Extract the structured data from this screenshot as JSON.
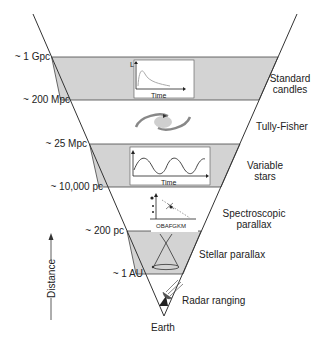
{
  "diagram": {
    "axis_label": "Distance",
    "base_label": "Earth",
    "colors": {
      "band_fill": "#d3d3d3",
      "line": "#333333",
      "background": "#ffffff"
    },
    "distance_markers": [
      {
        "label": "~ 1 Gpc"
      },
      {
        "label": "~ 200 Mpc"
      },
      {
        "label": "~ 25 Mpc"
      },
      {
        "label": "~ 10,000 pc"
      },
      {
        "label": "~ 200 pc"
      },
      {
        "label": "~ 1 AU"
      }
    ],
    "methods": [
      {
        "label_line1": "Standard",
        "label_line2": "candles",
        "icon": "luminosity-time-curve-icon",
        "inset_axis_x": "Time",
        "inset_axis_y": "L"
      },
      {
        "label_line1": "Tully-Fisher",
        "label_line2": "",
        "icon": "spiral-galaxy-icon"
      },
      {
        "label_line1": "Variable",
        "label_line2": "stars",
        "icon": "periodic-lightcurve-icon",
        "inset_axis_x": "Time"
      },
      {
        "label_line1": "Spectroscopic",
        "label_line2": "parallax",
        "icon": "hr-diagram-icon",
        "inset_axis_x": "OBAFGKM"
      },
      {
        "label_line1": "Stellar parallax",
        "label_line2": "",
        "icon": "parallax-cone-icon"
      },
      {
        "label_line1": "Radar ranging",
        "label_line2": "",
        "icon": "radar-dish-icon"
      }
    ]
  }
}
